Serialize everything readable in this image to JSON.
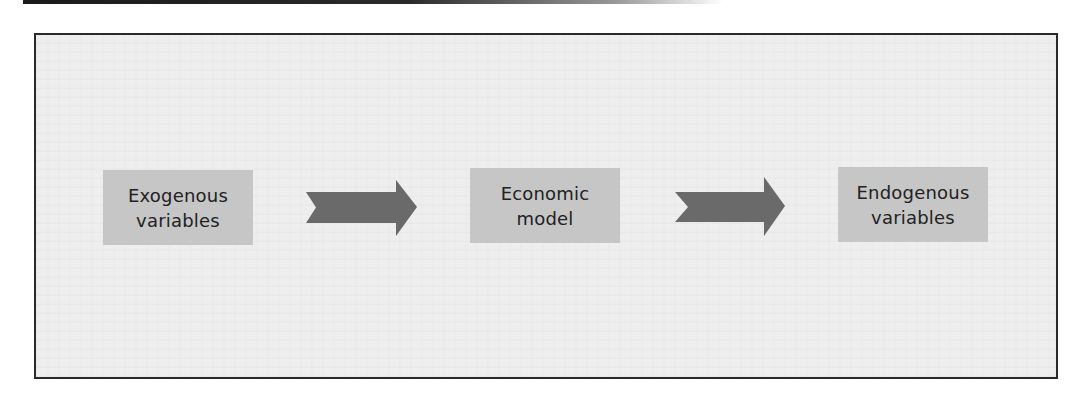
{
  "diagram": {
    "type": "flow",
    "direction": "left-to-right",
    "nodes": [
      {
        "id": "exogenous",
        "lines": [
          "Exogenous",
          "variables"
        ]
      },
      {
        "id": "model",
        "lines": [
          "Economic",
          "model"
        ]
      },
      {
        "id": "endogenous",
        "lines": [
          "Endogenous",
          "variables"
        ]
      }
    ],
    "edges": [
      {
        "from": "exogenous",
        "to": "model",
        "style": "notched-block-arrow"
      },
      {
        "from": "model",
        "to": "endogenous",
        "style": "notched-block-arrow"
      }
    ],
    "colors": {
      "node_fill": "#c6c6c6",
      "arrow_fill": "#6a6a6a",
      "background": "#eeeeee",
      "border": "#2a2a2a",
      "text": "#222222"
    }
  }
}
